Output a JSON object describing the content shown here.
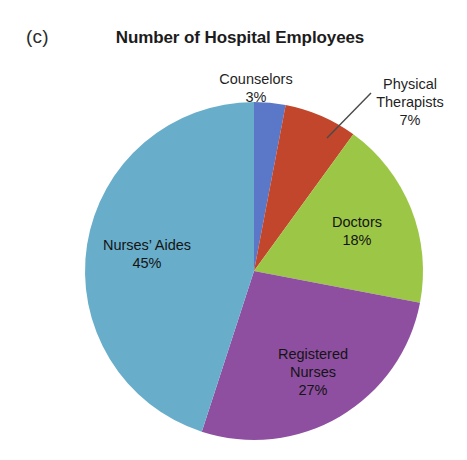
{
  "panel": {
    "letter": "(c)"
  },
  "title": "Number of Hospital Employees",
  "labels": {
    "counselors": {
      "name": "Counselors",
      "pct": "3%"
    },
    "physical_therapists": {
      "name_line1": "Physical",
      "name_line2": "Therapists",
      "pct": "7%"
    },
    "doctors": {
      "name": "Doctors",
      "pct": "18%"
    },
    "nurses_aides": {
      "name": "Nurses’ Aides",
      "pct": "45%"
    },
    "registered_nurses": {
      "name_line1": "Registered",
      "name_line2": "Nurses",
      "pct": "27%"
    }
  },
  "colors": {
    "nurses_aides": "#68aeca",
    "counselors": "#5b77c8",
    "physical_therapists": "#c1462b",
    "doctors": "#9cc746",
    "registered_nurses": "#8e4fa0",
    "background": "#ffffff",
    "text": "#1f1f1f",
    "leader_line": "#4a4a4a"
  },
  "chart_data": {
    "type": "pie",
    "title": "Number of Hospital Employees",
    "xlabel": "",
    "ylabel": "",
    "unit": "percent",
    "start_angle_deg": 0,
    "direction": "clockwise",
    "legend": "none",
    "labels_position": "in-slice and outside with leader line",
    "categories": [
      "Counselors",
      "Physical Therapists",
      "Doctors",
      "Registered Nurses",
      "Nurses' Aides"
    ],
    "values": [
      3,
      7,
      18,
      27,
      45
    ],
    "slice_colors": [
      "#5b77c8",
      "#c1462b",
      "#9cc746",
      "#8e4fa0",
      "#68aeca"
    ],
    "slices": [
      {
        "label": "Counselors",
        "value": 3,
        "pct_text": "3%",
        "color": "#5b77c8",
        "label_placement": "outside"
      },
      {
        "label": "Physical Therapists",
        "value": 7,
        "pct_text": "7%",
        "color": "#c1462b",
        "label_placement": "outside-leader-line"
      },
      {
        "label": "Doctors",
        "value": 18,
        "pct_text": "18%",
        "color": "#9cc746",
        "label_placement": "inside"
      },
      {
        "label": "Registered Nurses",
        "value": 27,
        "pct_text": "27%",
        "color": "#8e4fa0",
        "label_placement": "inside"
      },
      {
        "label": "Nurses' Aides",
        "value": 45,
        "pct_text": "45%",
        "color": "#68aeca",
        "label_placement": "inside"
      }
    ],
    "total": 100
  }
}
